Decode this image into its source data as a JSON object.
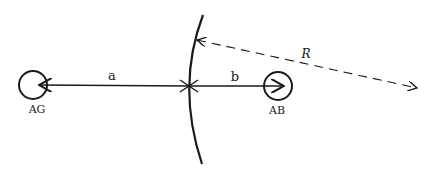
{
  "diagram": {
    "colors": {
      "stroke": "#1a1a1a",
      "background": "#ffffff"
    },
    "nodes": [
      {
        "id": "AG",
        "label": "AG",
        "cx": 33,
        "cy": 85,
        "r": 14,
        "label_x": 37,
        "label_y": 113
      },
      {
        "id": "AB",
        "label": "AB",
        "cx": 278,
        "cy": 86,
        "r": 14,
        "label_x": 277,
        "label_y": 114
      }
    ],
    "segments": [
      {
        "id": "a",
        "label": "a",
        "label_x": 112,
        "label_y": 80
      },
      {
        "id": "b",
        "label": "b",
        "label_x": 235,
        "label_y": 81
      }
    ],
    "radius": {
      "label": "R",
      "label_x": 306,
      "label_y": 58
    },
    "arc": {
      "description": "curved boundary surface"
    }
  }
}
